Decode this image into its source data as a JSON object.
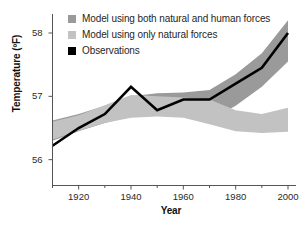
{
  "chart_data": {
    "type": "line",
    "title": "",
    "xlabel": "Year",
    "ylabel": "Temperature (ºF)",
    "xlim": [
      1910,
      2000
    ],
    "ylim": [
      55.6,
      58.3
    ],
    "xticks": [
      1920,
      1940,
      1960,
      1980,
      2000
    ],
    "xtick_labels": [
      "1920",
      "1940",
      "1960",
      "1980",
      "2000"
    ],
    "xminor_ticks": [
      1910,
      1930,
      1950,
      1970,
      1990
    ],
    "yticks": [
      56,
      57,
      58
    ],
    "ytick_labels": [
      "56",
      "57",
      "58"
    ],
    "grid": false,
    "legend_position": "top-left",
    "series": [
      {
        "name": "Model using both natural and human forces",
        "type": "band",
        "color": "#9a9a9a",
        "x": [
          1910,
          1920,
          1930,
          1940,
          1950,
          1960,
          1970,
          1980,
          1990,
          2000
        ],
        "upper": [
          56.62,
          56.72,
          56.85,
          57.0,
          57.05,
          57.06,
          57.1,
          57.35,
          57.68,
          58.2
        ],
        "lower": [
          56.3,
          56.45,
          56.58,
          56.68,
          56.7,
          56.72,
          56.62,
          56.85,
          57.15,
          57.55
        ]
      },
      {
        "name": "Model using only natural forces",
        "type": "band",
        "color": "#c2c2c2",
        "x": [
          1910,
          1920,
          1930,
          1940,
          1950,
          1960,
          1970,
          1980,
          1990,
          2000
        ],
        "upper": [
          56.6,
          56.7,
          56.86,
          57.02,
          57.0,
          56.98,
          56.95,
          56.78,
          56.72,
          56.82
        ],
        "lower": [
          56.32,
          56.46,
          56.58,
          56.66,
          56.68,
          56.66,
          56.56,
          56.45,
          56.42,
          56.44
        ]
      },
      {
        "name": "Observations",
        "type": "line",
        "color": "#000000",
        "x": [
          1910,
          1920,
          1930,
          1940,
          1950,
          1960,
          1970,
          1980,
          1990,
          2000
        ],
        "y": [
          56.22,
          56.5,
          56.72,
          57.15,
          56.78,
          56.95,
          56.95,
          57.2,
          57.45,
          58.0
        ]
      }
    ]
  },
  "legend": {
    "items": [
      {
        "label": "Model using both natural and human forces",
        "color": "#9a9a9a"
      },
      {
        "label": "Model using only natural forces",
        "color": "#c2c2c2"
      },
      {
        "label": "Observations",
        "color": "#000000"
      }
    ]
  },
  "axes": {
    "y_title": "Temperature (ºF)",
    "x_title": "Year",
    "y_tick_labels": [
      "58",
      "57",
      "56"
    ],
    "x_tick_labels": [
      "1920",
      "1940",
      "1960",
      "1980",
      "2000"
    ]
  }
}
